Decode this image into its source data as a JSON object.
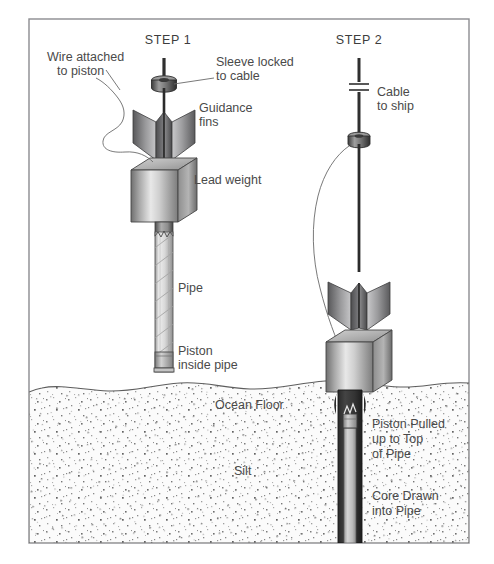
{
  "figure": {
    "frame_color": "#8c8c90",
    "background_color": "#ffffff",
    "water_color": "#ffffff",
    "silt_color": "#f6f6f6",
    "metal_color": "#b9b9b9",
    "ink_color": "#4a4a4a"
  },
  "steps": [
    {
      "id": "step1",
      "label": "STEP 1"
    },
    {
      "id": "step2",
      "label": "STEP 2"
    }
  ],
  "labels": {
    "wire_attached": "Wire attached\nto piston",
    "wire_attached_l1": "Wire attached",
    "wire_attached_l2": "to piston",
    "sleeve_locked_l1": "Sleeve locked",
    "sleeve_locked_l2": "to cable",
    "guidance_fins_l1": "Guidance",
    "guidance_fins_l2": "fins",
    "lead_weight": "Lead weight",
    "pipe": "Pipe",
    "piston_inside_l1": "Piston",
    "piston_inside_l2": "inside pipe",
    "ocean_floor": "Ocean Floor",
    "silt": "Silt",
    "cable_to_ship_l1": "Cable",
    "cable_to_ship_l2": "to ship",
    "piston_pulled_l1": "Piston Pulled",
    "piston_pulled_l2": "up to Top",
    "piston_pulled_l3": "of Pipe",
    "core_drawn_l1": "Core Drawn",
    "core_drawn_l2": "into Pipe"
  }
}
